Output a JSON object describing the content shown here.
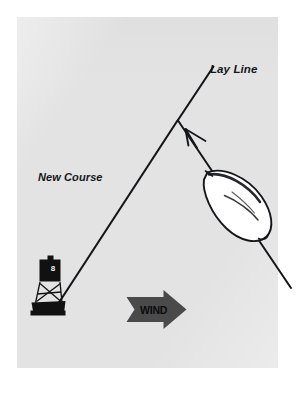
{
  "figure": {
    "kind": "sailing-tactics-diagram",
    "background_color": "#ffffff",
    "plate_color": "#e3e3e3",
    "ink_color": "#15161a",
    "wind_arrow_color": "#4a4a4a",
    "hull_fill_color": "#ffffff"
  },
  "labels": {
    "lay_line": "Lay Line",
    "new_course": "New Course",
    "wind": "WIND"
  },
  "mark": {
    "name": "racing-mark-buoy",
    "number": "8",
    "board_color": "#111111",
    "base_color": "#111111"
  },
  "elements": {
    "lay_line_name": "lay-line",
    "new_course_name": "new-course-line",
    "boat_track_name": "boat-track-line",
    "heading_arrow_name": "boat-heading-arrow",
    "hull_name": "sailboat-hull",
    "wind_arrow_name": "wind-direction-arrow"
  },
  "geometry": {
    "apex": {
      "x": 178,
      "y": 120
    },
    "lay_line_top": {
      "x": 213,
      "y": 67
    },
    "new_course_end": {
      "x": 52,
      "y": 313
    },
    "boat_track_end": {
      "x": 291,
      "y": 288
    },
    "wind_direction": "left-to-right"
  }
}
